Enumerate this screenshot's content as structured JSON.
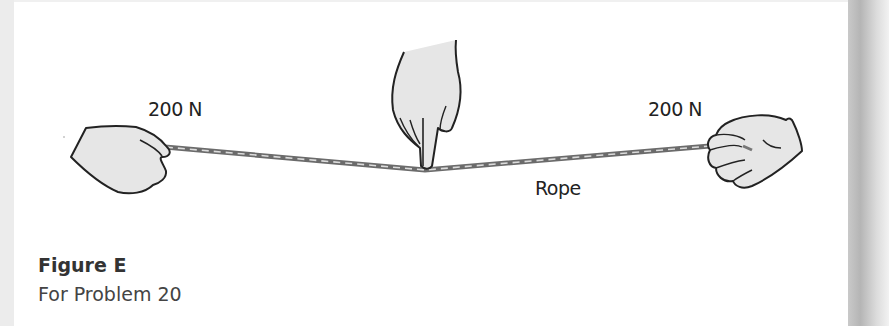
{
  "figure": {
    "labels": {
      "left_force": "200 N",
      "right_force": "200 N",
      "rope": "Rope"
    },
    "caption": {
      "title": "Figure E",
      "subtitle": "For Problem 20"
    },
    "colors": {
      "hand_fill": "#e6e6e6",
      "outline": "#222222",
      "rope_dark": "#6b6b6b",
      "rope_light": "#d8d8d8",
      "side_shadow": "#b5b5b5"
    }
  }
}
